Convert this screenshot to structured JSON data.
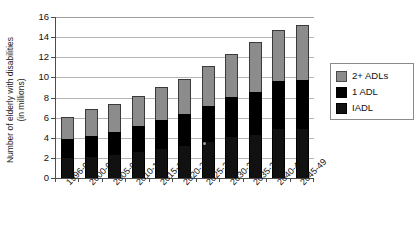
{
  "chart_data": {
    "type": "bar",
    "subtype": "stacked-bar",
    "title": "",
    "xlabel": "",
    "ylabel": "Number of elderly with disabilities (in millions)",
    "ylabel_line1": "Number of elderly with disabilities",
    "ylabel_line2": "(in millions)",
    "ylim": [
      0,
      16
    ],
    "ytick_values": [
      0,
      2,
      4,
      6,
      8,
      10,
      12,
      14,
      16
    ],
    "ytick_labels": [
      "0",
      "2",
      "4",
      "6",
      "8",
      "10",
      "12",
      "14",
      "16"
    ],
    "grid": true,
    "grid_axis": "y",
    "legend_position": "right",
    "categories": [
      "1996-00",
      "2000-04",
      "2005-09",
      "2010-14",
      "2015-19",
      "2020-24",
      "2025-29",
      "2030-34",
      "2035-39",
      "2040-44",
      "2045-49"
    ],
    "series": [
      {
        "name": "IADL",
        "color": "#111111",
        "values": [
          2.1,
          2.2,
          2.4,
          2.7,
          3.0,
          3.3,
          3.7,
          4.2,
          4.4,
          5.0,
          5.0
        ]
      },
      {
        "name": "1 ADL",
        "color": "#000000",
        "values": [
          1.8,
          2.0,
          2.2,
          2.5,
          2.8,
          3.1,
          3.5,
          3.9,
          4.1,
          4.6,
          4.7
        ]
      },
      {
        "name": "2+ ADLs",
        "color": "#8c8c8c",
        "values": [
          2.2,
          2.7,
          2.8,
          3.0,
          3.2,
          3.4,
          3.9,
          4.2,
          5.0,
          5.1,
          5.5
        ]
      }
    ],
    "stack_order_bottom_to_top": [
      "IADL",
      "1 ADL",
      "2+ ADLs"
    ],
    "dark_segment_tops": [
      3.9,
      4.2,
      4.6,
      5.2,
      5.8,
      6.4,
      7.2,
      8.1,
      8.5,
      9.6,
      9.7
    ],
    "totals": [
      6.1,
      6.9,
      7.4,
      8.2,
      9.0,
      9.8,
      11.1,
      12.3,
      13.5,
      14.7,
      15.2
    ]
  },
  "legend": {
    "items": [
      {
        "label": "2+ ADLs",
        "color": "#8c8c8c"
      },
      {
        "label": "1 ADL",
        "color": "#000000"
      },
      {
        "label": "IADL",
        "color": "#111111"
      }
    ]
  },
  "colors": {
    "axis": "#4d4d4d",
    "grid": "#b5b5b5",
    "background": "#ffffff",
    "text": "#111111"
  }
}
